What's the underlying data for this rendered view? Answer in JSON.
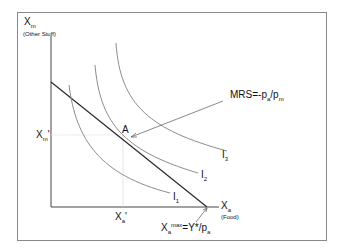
{
  "diagram": {
    "type": "indifference-curve-budget-constraint",
    "y_axis": {
      "label_main": "X",
      "label_sub": "m",
      "label_note": "(Other Stuff)"
    },
    "x_axis": {
      "label_main": "X",
      "label_sub": "a",
      "label_note": "(Food)"
    },
    "y_tick": {
      "main": "X",
      "sub": "m",
      "prime": "'"
    },
    "x_tick": {
      "main": "X",
      "sub": "a",
      "prime": "'"
    },
    "point": {
      "label": "A"
    },
    "mrs_label": {
      "prefix": "MRS=-p",
      "sub1": "a",
      "mid": "/p",
      "sub2": "m"
    },
    "xmax_label": {
      "main": "X",
      "sub": "a",
      "sup": "max",
      "rest": "=Y*/p",
      "sub2": "a"
    },
    "curves": [
      {
        "name": "I",
        "sub": "1"
      },
      {
        "name": "I",
        "sub": "2"
      },
      {
        "name": "I",
        "sub": "3"
      }
    ],
    "colors": {
      "budget_line": "#2a2a2a",
      "curves": "#8c8c8c",
      "axes": "#444444",
      "frame": "#8a8a8a"
    }
  }
}
